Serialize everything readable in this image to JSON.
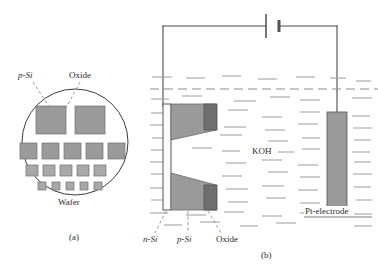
{
  "figure": {
    "panels": [
      {
        "id": "a",
        "caption": "(a)",
        "labels": {
          "p_si": "p-Si",
          "oxide": "Oxide",
          "wafer": "Wafer"
        }
      },
      {
        "id": "b",
        "caption": "(b)",
        "labels": {
          "koh": "KOH",
          "pt_electrode": "Pt-electrode",
          "n_si": "n-Si",
          "p_si": "p-Si",
          "oxide": "Oxide"
        }
      }
    ]
  },
  "colors": {
    "outline": "#3a3a3a",
    "mid_gray": "#9a9a9a",
    "dark_gray": "#6e6e6e",
    "light_gray": "#b8b8b8",
    "liquid_dash": "#8c8c8c",
    "text": "#2b2b2b",
    "white": "#ffffff"
  },
  "panel_a": {
    "wafer_circle": {
      "cx": 75,
      "cy": 142,
      "r": 53
    },
    "large_squares": [
      {
        "x": 36,
        "y": 106,
        "w": 30,
        "h": 28
      },
      {
        "x": 75,
        "y": 106,
        "w": 30,
        "h": 28
      }
    ],
    "row_medium": [
      {
        "x": 20,
        "y": 143,
        "w": 17,
        "h": 16
      },
      {
        "x": 42,
        "y": 143,
        "w": 17,
        "h": 16
      },
      {
        "x": 64,
        "y": 143,
        "w": 17,
        "h": 16
      },
      {
        "x": 86,
        "y": 143,
        "w": 17,
        "h": 16
      },
      {
        "x": 108,
        "y": 143,
        "w": 17,
        "h": 16
      }
    ],
    "row_small": [
      {
        "x": 26,
        "y": 165,
        "w": 12,
        "h": 11
      },
      {
        "x": 43,
        "y": 165,
        "w": 12,
        "h": 11
      },
      {
        "x": 60,
        "y": 165,
        "w": 12,
        "h": 11
      },
      {
        "x": 77,
        "y": 165,
        "w": 12,
        "h": 11
      },
      {
        "x": 94,
        "y": 165,
        "w": 12,
        "h": 11
      }
    ],
    "row_tiny": [
      {
        "x": 38,
        "y": 182,
        "w": 8,
        "h": 8
      },
      {
        "x": 52,
        "y": 182,
        "w": 8,
        "h": 8
      },
      {
        "x": 66,
        "y": 182,
        "w": 8,
        "h": 8
      },
      {
        "x": 80,
        "y": 182,
        "w": 8,
        "h": 8
      },
      {
        "x": 94,
        "y": 182,
        "w": 8,
        "h": 8
      }
    ]
  },
  "panel_b": {
    "liquid_level_y": 89,
    "circuit": {
      "left_wire_x": 163,
      "right_wire_x": 337,
      "top_wire_y": 26,
      "battery_center_x": 272
    },
    "wafer_block": {
      "x": 163,
      "y": 104,
      "w": 56,
      "h": 106
    },
    "pt_electrode": {
      "x": 327,
      "y": 112,
      "w": 20,
      "h": 95
    }
  }
}
